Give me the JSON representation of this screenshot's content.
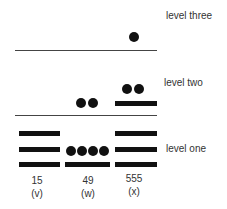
{
  "levels": {
    "three": "level three",
    "two": "level two",
    "one": "level one"
  },
  "columns": [
    {
      "value": "15",
      "label": "(v)",
      "level_one": {
        "bars": 3,
        "dots": 0
      },
      "level_two": {
        "bars": 0,
        "dots": 0
      },
      "level_three": {
        "bars": 0,
        "dots": 0
      }
    },
    {
      "value": "49",
      "label": "(w)",
      "level_one": {
        "bars": 1,
        "dots": 4
      },
      "level_two": {
        "bars": 0,
        "dots": 2
      },
      "level_three": {
        "bars": 0,
        "dots": 0
      }
    },
    {
      "value": "555",
      "label": "(x)",
      "level_one": {
        "bars": 3,
        "dots": 0
      },
      "level_two": {
        "bars": 1,
        "dots": 2
      },
      "level_three": {
        "bars": 0,
        "dots": 1
      }
    }
  ]
}
